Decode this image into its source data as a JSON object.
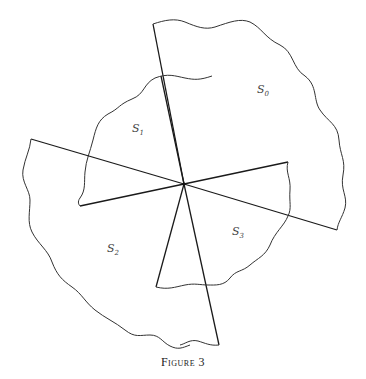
{
  "figure": {
    "caption": "Figure 3",
    "center": [
      184,
      184
    ],
    "sectors": [
      {
        "id": "S0",
        "label_main": "S",
        "label_sub": "0",
        "label_pos": [
          257,
          93
        ]
      },
      {
        "id": "S1",
        "label_main": "S",
        "label_sub": "1",
        "label_pos": [
          132,
          132
        ]
      },
      {
        "id": "S2",
        "label_main": "S",
        "label_sub": "2",
        "label_pos": [
          107,
          252
        ]
      },
      {
        "id": "S3",
        "label_main": "S",
        "label_sub": "3",
        "label_pos": [
          232,
          235
        ]
      }
    ],
    "colors": {
      "line": "#1a1a1a",
      "text": "#444444"
    }
  }
}
